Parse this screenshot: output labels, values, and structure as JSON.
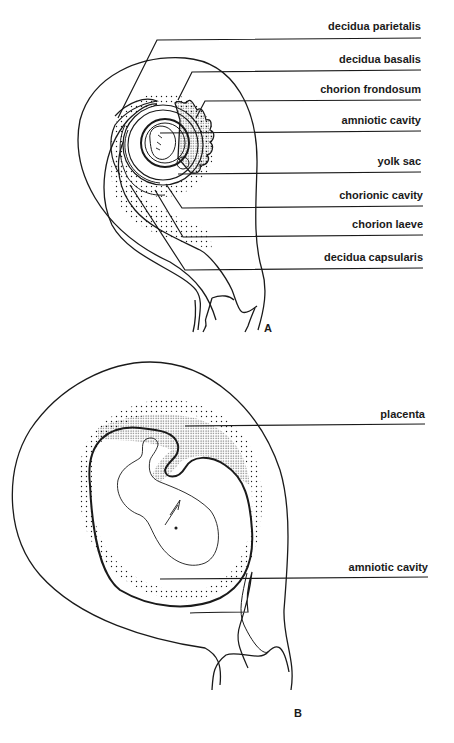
{
  "figure": {
    "panel_a": {
      "letter": "A",
      "labels": [
        {
          "text": "decidua parietalis",
          "text_y": 26,
          "line_y": 38
        },
        {
          "text": "decidua basalis",
          "text_y": 59,
          "line_y": 70
        },
        {
          "text": "chorion frondosum",
          "text_y": 88,
          "line_y": 100
        },
        {
          "text": "amniotic cavity",
          "text_y": 120,
          "line_y": 131
        },
        {
          "text": "yolk sac",
          "text_y": 161,
          "line_y": 172
        },
        {
          "text": "chorionic cavity",
          "text_y": 194,
          "line_y": 206
        },
        {
          "text": "chorion laeve",
          "text_y": 223,
          "line_y": 235
        },
        {
          "text": "decidua capsularis",
          "text_y": 256,
          "line_y": 268
        }
      ]
    },
    "panel_b": {
      "letter": "B",
      "labels": [
        {
          "text": "placenta",
          "text_y": 413,
          "line_y": 424
        },
        {
          "text": "amniotic cavity",
          "text_y": 565,
          "line_y": 578
        }
      ]
    },
    "colors": {
      "ink": "#1a1a1a",
      "background": "#ffffff"
    }
  }
}
